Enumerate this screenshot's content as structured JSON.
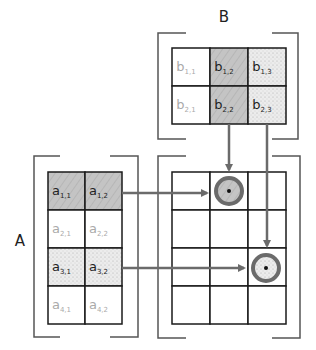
{
  "labels": {
    "A": "A",
    "B": "B"
  },
  "matrix_a": {
    "rows": 4,
    "cols": 2,
    "cells": [
      {
        "base": "a",
        "sub": "1,1",
        "style": "hatch"
      },
      {
        "base": "a",
        "sub": "1,2",
        "style": "hatch"
      },
      {
        "base": "a",
        "sub": "2,1",
        "style": "plain"
      },
      {
        "base": "a",
        "sub": "2,2",
        "style": "plain"
      },
      {
        "base": "a",
        "sub": "3,1",
        "style": "dots"
      },
      {
        "base": "a",
        "sub": "3,2",
        "style": "dots"
      },
      {
        "base": "a",
        "sub": "4,1",
        "style": "plain"
      },
      {
        "base": "a",
        "sub": "4,2",
        "style": "plain"
      }
    ]
  },
  "matrix_b": {
    "rows": 2,
    "cols": 3,
    "cells": [
      {
        "base": "b",
        "sub": "1,1",
        "style": "plain"
      },
      {
        "base": "b",
        "sub": "1,2",
        "style": "hatch"
      },
      {
        "base": "b",
        "sub": "1,3",
        "style": "dots"
      },
      {
        "base": "b",
        "sub": "2,1",
        "style": "plain"
      },
      {
        "base": "b",
        "sub": "2,2",
        "style": "hatch"
      },
      {
        "base": "b",
        "sub": "2,3",
        "style": "dots"
      }
    ]
  },
  "matrix_c": {
    "rows": 4,
    "cols": 3,
    "highlighted": [
      {
        "row": 1,
        "col": 2,
        "style": "hatch"
      },
      {
        "row": 3,
        "col": 3,
        "style": "dots"
      }
    ]
  },
  "colors": {
    "grid": "#1a1a1a",
    "bracket": "#555555",
    "arrow": "#6b6b6b",
    "hatch_fill": "#c4c4c4",
    "dots_fill": "#ececec",
    "ring": "#6b6b6b"
  }
}
